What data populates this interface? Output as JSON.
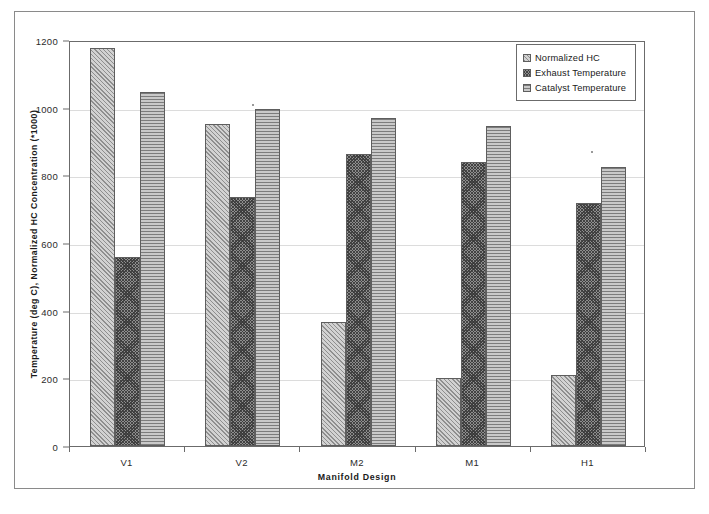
{
  "chart_data": {
    "type": "bar",
    "title": "",
    "xlabel": "Manifold Design",
    "ylabel": "Temperature (deg C), Normalized HC Concentration (*1000)",
    "categories": [
      "V1",
      "V2",
      "M2",
      "M1",
      "H1"
    ],
    "series": [
      {
        "name": "Normalized HC",
        "values": [
          1175,
          952,
          367,
          202,
          211
        ],
        "pattern": "diagonal-hatch",
        "color": "#d2d2d2"
      },
      {
        "name": "Exhaust Temperature",
        "values": [
          560,
          735,
          862,
          840,
          718
        ],
        "pattern": "checkerboard",
        "color": "#8e8e8e"
      },
      {
        "name": "Catalyst Temperature",
        "values": [
          1045,
          995,
          970,
          945,
          825
        ],
        "pattern": "horizontal-lines",
        "color": "#c9c9c9"
      }
    ],
    "ylim": [
      0,
      1200
    ],
    "yticks": [
      0,
      200,
      400,
      600,
      800,
      1000,
      1200
    ],
    "ytick_labels": [
      "0",
      "200",
      "400",
      "600",
      "800",
      "1000",
      "1200"
    ],
    "grid": true,
    "grid_axis": "y",
    "legend_position": "top-right",
    "bar_border_color": "#5e5e5e",
    "gridline_color": "#dcdcdc",
    "axis_color": "#6b6b6b"
  },
  "legend": {
    "items": [
      {
        "label": "Normalized HC"
      },
      {
        "label": "Exhaust Temperature"
      },
      {
        "label": "Catalyst Temperature"
      }
    ]
  }
}
